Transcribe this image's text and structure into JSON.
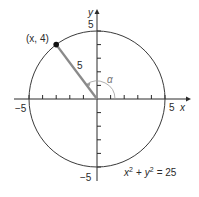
{
  "diagram": {
    "type": "unit-circle-style diagram",
    "equation": {
      "lhs_x": "x",
      "sup1": "2",
      "plus": "+",
      "lhs_y": "y",
      "sup2": "2",
      "eq": "= 25"
    },
    "point_label": "(x, 4)",
    "radius_label": "5",
    "angle_label": "α",
    "axes": {
      "x_label": "x",
      "y_label": "y",
      "x_pos_tick": "5",
      "x_neg_tick": "−5",
      "y_pos_tick": "5",
      "y_neg_tick": "−5"
    },
    "colors": {
      "circle": "#3a3a3a",
      "axes": "#2a2a2a",
      "radius_segment": "#8a8a8a",
      "point": "#111111",
      "angle_arc": "#9a9a9a"
    }
  }
}
